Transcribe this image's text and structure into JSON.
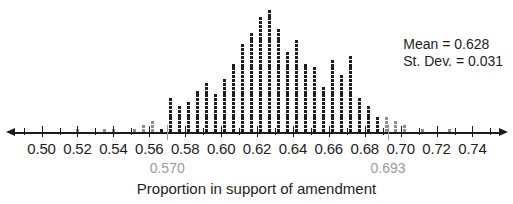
{
  "chart_data": {
    "type": "bar",
    "title": "",
    "subtitle": "",
    "xlabel": "Proportion in support of amendment",
    "ylabel": "",
    "grid": false,
    "legend": "none",
    "dot_plot": true,
    "xlim": [
      0.488,
      0.752
    ],
    "ylim": [
      0,
      33
    ],
    "bin_width": 0.005,
    "axis_tick_labels": [
      "0.50",
      "0.52",
      "0.54",
      "0.56",
      "0.58",
      "0.60",
      "0.62",
      "0.64",
      "0.66",
      "0.68",
      "0.70",
      "0.72",
      "0.74"
    ],
    "axis_tick_values": [
      0.5,
      0.52,
      0.54,
      0.56,
      0.58,
      0.6,
      0.62,
      0.64,
      0.66,
      0.68,
      0.7,
      0.72,
      0.74
    ],
    "minor_tick_values": [
      0.49,
      0.51,
      0.53,
      0.55,
      0.57,
      0.59,
      0.61,
      0.63,
      0.65,
      0.67,
      0.69,
      0.71,
      0.73,
      0.75
    ],
    "x": [
      0.52,
      0.535,
      0.54,
      0.552,
      0.557,
      0.562,
      0.567,
      0.572,
      0.577,
      0.582,
      0.587,
      0.592,
      0.597,
      0.602,
      0.607,
      0.612,
      0.617,
      0.622,
      0.627,
      0.632,
      0.637,
      0.642,
      0.647,
      0.652,
      0.657,
      0.662,
      0.667,
      0.672,
      0.677,
      0.682,
      0.687,
      0.692,
      0.697,
      0.702,
      0.712,
      0.727
    ],
    "values": [
      1,
      1,
      1,
      1,
      2,
      3,
      1,
      9,
      7,
      8,
      11,
      13,
      10,
      14,
      18,
      23,
      26,
      30,
      32,
      27,
      21,
      24,
      18,
      17,
      12,
      19,
      15,
      20,
      9,
      7,
      4,
      4,
      3,
      2,
      1,
      1
    ],
    "annotations": [
      {
        "name": "mean",
        "label": "Mean = 0.628",
        "value": 0.628
      },
      {
        "name": "std-dev",
        "label": "St. Dev. = 0.031",
        "value": 0.031
      }
    ],
    "reference_lines": [
      {
        "name": "lower-reference",
        "label": "0.570",
        "value": 0.57,
        "color": "#9a9a9a"
      },
      {
        "name": "upper-reference",
        "label": "0.693",
        "value": 0.693,
        "color": "#9a9a9a"
      }
    ],
    "colors": {
      "dot": "#1d1d1d",
      "axis": "#1d1d1d",
      "reference": "#9a9a9a"
    }
  },
  "stats": {
    "mean_label": "Mean = 0.628",
    "stdev_label": "St. Dev. = 0.031"
  },
  "axis": {
    "title": "Proportion in support of amendment"
  }
}
